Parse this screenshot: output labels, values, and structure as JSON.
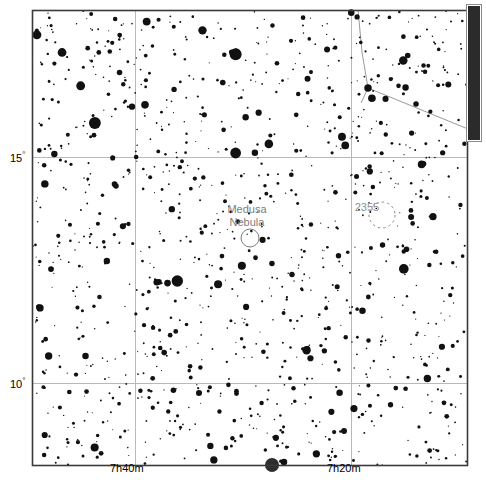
{
  "chart_data": {
    "type": "scatter",
    "title": "",
    "xlabel": "Right Ascension",
    "ylabel": "Declination",
    "grid": true,
    "frame": {
      "x": 32,
      "y": 10,
      "width": 436,
      "height": 456
    },
    "axis_ranges": {
      "ra_hours": [
        7.1667,
        7.8333
      ],
      "dec_degrees": [
        7.5,
        17.6
      ]
    },
    "x_ticks": [
      {
        "label": "7h40m",
        "pixel": 135
      },
      {
        "label": "7h20m",
        "pixel": 351
      }
    ],
    "y_ticks": [
      {
        "label": "15",
        "unit": "°",
        "pixel": 157
      },
      {
        "label": "10",
        "unit": "°",
        "pixel": 383
      }
    ],
    "gridlines": {
      "vertical_px": [
        135,
        351
      ],
      "horizontal_px": [
        157,
        383
      ],
      "color": "#b9b9b9"
    },
    "deep_sky_objects": [
      {
        "name": "Medusa Nebula",
        "label_line_1": "Medusa",
        "label_line_2": "Nebula",
        "symbol": "circle",
        "cx": 250,
        "cy": 238,
        "r": 9,
        "label_x": 247,
        "label_y": 213,
        "color": "#7d7d7d"
      },
      {
        "name": "2355",
        "label_line_1": "2355",
        "label_line_2": "",
        "symbol": "dashed-circle",
        "cx": 382,
        "cy": 215,
        "r": 13,
        "label_x": 367,
        "label_y": 211,
        "color": "#8e8e8e"
      }
    ],
    "constellation_lines": [
      {
        "x1": 358,
        "y1": 10,
        "x2": 362,
        "y2": 52
      },
      {
        "x1": 362,
        "y1": 52,
        "x2": 368,
        "y2": 88
      },
      {
        "x1": 368,
        "y1": 88,
        "x2": 468,
        "y2": 129
      },
      {
        "x1": 368,
        "y1": 88,
        "x2": 361,
        "y2": 103
      }
    ],
    "named_bright_stars": [
      {
        "x": 368,
        "y": 88,
        "mag_px": 7.5
      },
      {
        "x": 416,
        "y": 104,
        "mag_px": 5.5
      },
      {
        "x": 272,
        "y": 464,
        "mag_px": 7.0
      },
      {
        "x": 116,
        "y": 186,
        "mag_px": 5.5
      }
    ],
    "star_count": 1180,
    "star_color": "#111111",
    "background": "#ffffff"
  },
  "labels": {
    "dec_15": "15",
    "dec_15_unit": "°",
    "dec_10": "10",
    "dec_10_unit": "°",
    "ra_7h40m": "7h40m",
    "ra_7h20m": "7h20m",
    "medusa_line1": "Medusa",
    "medusa_line2": "Nebula",
    "cluster_2355": "2355"
  },
  "scrollbar": {
    "orientation": "vertical",
    "thumb_top_px": 6,
    "thumb_height_px": 134,
    "color": "#2b2b2b"
  }
}
